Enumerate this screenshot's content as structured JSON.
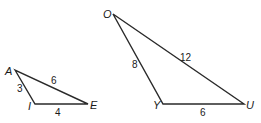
{
  "figure": {
    "triangles": [
      {
        "name": "AIE",
        "vertices": {
          "A": {
            "label": "A",
            "x": 15,
            "y": 70
          },
          "I": {
            "label": "I",
            "x": 35,
            "y": 104
          },
          "E": {
            "label": "E",
            "x": 88,
            "y": 104
          }
        },
        "sides": {
          "AI": {
            "label": "3"
          },
          "AE": {
            "label": "6"
          },
          "IE": {
            "label": "4"
          }
        }
      },
      {
        "name": "OYU",
        "vertices": {
          "O": {
            "label": "O",
            "x": 113,
            "y": 14
          },
          "Y": {
            "label": "Y",
            "x": 163,
            "y": 104
          },
          "U": {
            "label": "U",
            "x": 244,
            "y": 104
          }
        },
        "sides": {
          "OY": {
            "label": "8"
          },
          "OU": {
            "label": "12"
          },
          "YU": {
            "label": "6"
          }
        }
      }
    ]
  }
}
